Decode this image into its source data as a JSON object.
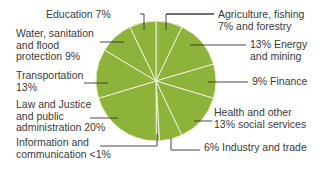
{
  "chart_data": {
    "type": "pie",
    "title": "",
    "slice_color": "#8db33a",
    "divider_color": "#eef3d6",
    "leader_color": "#333333",
    "slices": [
      {
        "label": "Agriculture, fishing and forestry",
        "value": 7,
        "display": "Agriculture, fishing\n7% and forestry"
      },
      {
        "label": "Energy and mining",
        "value": 13,
        "display": "13% Energy\nand mining"
      },
      {
        "label": "Finance",
        "value": 9,
        "display": "9% Finance"
      },
      {
        "label": "Health and other social services",
        "value": 13,
        "display": "Health and other\n13% social services"
      },
      {
        "label": "Industry and trade",
        "value": 6,
        "display": "6% Industry and trade"
      },
      {
        "label": "Information and communication",
        "value": 0.8,
        "display": "Information and\ncommunication <1%"
      },
      {
        "label": "Law and Justice and public administration",
        "value": 20,
        "display": "Law and Justice\nand public\nadministration 20%"
      },
      {
        "label": "Transportation",
        "value": 13,
        "display": "Transportation\n13%"
      },
      {
        "label": "Water, sanitation and flood protection",
        "value": 9,
        "display": "Water, sanitation\nand flood\nprotection 9%"
      },
      {
        "label": "Education",
        "value": 7,
        "display": "Education 7%"
      }
    ]
  }
}
